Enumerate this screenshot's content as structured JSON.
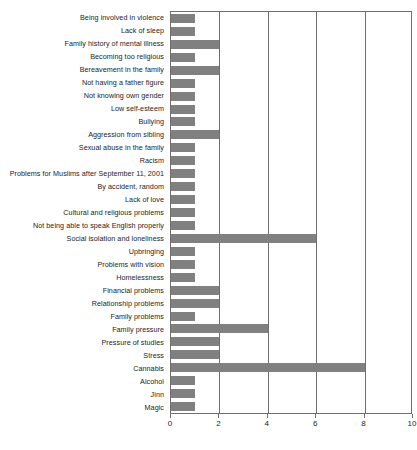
{
  "chart_data": {
    "type": "bar",
    "orientation": "horizontal",
    "title": "",
    "xlabel": "",
    "ylabel": "",
    "xlim": [
      0,
      10
    ],
    "xticks": [
      "0",
      "2",
      "4",
      "6",
      "8",
      "10"
    ],
    "grid": true,
    "legend": "none",
    "bar_color": "#808080",
    "axis_color": "#6f6f6f",
    "categories": [
      "Being involved in violence",
      "Lack of sleep",
      "Family history of mental illness",
      "Becoming too religious",
      "Bereavement in the family",
      "Not having a father figure",
      "Not knowing own gender",
      "Low self-esteem",
      "Bullying",
      "Aggression from sibling",
      "Sexual abuse in the family",
      "Racism",
      "Problems for Muslims after September 11, 2001",
      "By accident, random",
      "Lack of love",
      "Cultural and religious problems",
      "Not being able to speak English properly",
      "Social isolation and loneliness",
      "Upbringing",
      "Problems with vision",
      "Homelessness",
      "Financial problems",
      "Relationship problems",
      "Family problems",
      "Family pressure",
      "Pressure of studies",
      "Stress",
      "Cannabis",
      "Alcohol",
      "Jinn",
      "Magic"
    ],
    "values": [
      1,
      1,
      2,
      1,
      2,
      1,
      1,
      1,
      1,
      2,
      1,
      1,
      1,
      1,
      1,
      1,
      1,
      6,
      1,
      1,
      1,
      2,
      2,
      1,
      4,
      2,
      2,
      8,
      1,
      1,
      1
    ]
  }
}
